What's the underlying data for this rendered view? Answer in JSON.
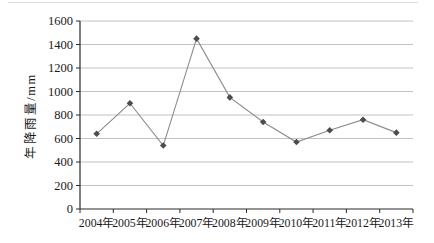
{
  "chart_data": {
    "type": "line",
    "title": "",
    "categories": [
      "2004年",
      "2005年",
      "2006年",
      "2007年",
      "2008年",
      "2009年",
      "2010年",
      "2011年",
      "2012年",
      "2013年"
    ],
    "values": [
      640,
      900,
      540,
      1450,
      950,
      740,
      570,
      670,
      760,
      650
    ],
    "series_name": "年降雨量",
    "xlabel": "",
    "ylabel": "年降雨量/mm",
    "ylim": [
      0,
      1600
    ],
    "yticks": [
      0,
      200,
      400,
      600,
      800,
      1000,
      1200,
      1400,
      1600
    ],
    "grid": "horizontal",
    "legend": "none",
    "marker_shape": "diamond",
    "colors": {
      "line": "#8c8c8c",
      "marker": "#4d4d4d",
      "gridline": "#c2c2c2",
      "axis": "#2b2b2b",
      "text": "#1a1a1a",
      "background": "#ffffff",
      "page_edge_line": "#dcdcdc"
    }
  }
}
